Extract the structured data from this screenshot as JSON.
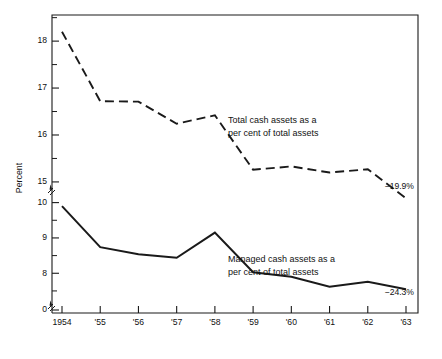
{
  "chart_data": {
    "type": "line",
    "title": "",
    "subtitle": "",
    "xlabel": "",
    "ylabel": "Percent",
    "grid": false,
    "legend_position": "inline-annotation",
    "x": [
      1954,
      1955,
      1956,
      1957,
      1958,
      1959,
      1960,
      1961,
      1962,
      1963
    ],
    "xtick_labels": [
      "1954",
      "'55",
      "'56",
      "'57",
      "'58",
      "'59",
      "'60",
      "'61",
      "'62",
      "'63"
    ],
    "y_axis_broken": true,
    "y_upper_range": [
      14.7,
      18.45
    ],
    "y_lower_range": [
      7.3,
      10.3
    ],
    "y_zero_shown": true,
    "ytick_labels_upper": [
      "18",
      "17",
      "16",
      "15"
    ],
    "ytick_values_upper": [
      18,
      17,
      16,
      15
    ],
    "ytick_minor_upper": [
      18.5,
      17.5,
      16.5,
      15.5
    ],
    "ytick_labels_lower": [
      "10",
      "9",
      "8"
    ],
    "ytick_values_lower": [
      10,
      9,
      8
    ],
    "ytick_minor_lower": [
      9.5,
      8.5,
      7.5
    ],
    "ytick_label_zero": "0",
    "series": [
      {
        "name": "Total cash assets as a per cent of total assets",
        "style": "dashed",
        "annotation": "Total cash assets as a\nper cent of total assets",
        "annotation_line1": "Total cash assets as a",
        "annotation_line2": "per cent of total assets",
        "end_label": "−19.9%",
        "values": [
          18.2,
          16.72,
          16.71,
          16.24,
          16.42,
          15.26,
          15.33,
          15.2,
          15.27,
          14.65
        ]
      },
      {
        "name": "Managed cash assets as a per cent of total assets",
        "style": "solid",
        "annotation": "Managed cash assets as a\nper cent of total assets",
        "annotation_line1": "Managed cash assets as a",
        "annotation_line2": "per cent of total assets",
        "end_label": "−24.3%",
        "values": [
          9.9,
          8.74,
          8.54,
          8.44,
          9.15,
          8.03,
          7.9,
          7.62,
          7.76,
          7.55
        ]
      }
    ]
  }
}
